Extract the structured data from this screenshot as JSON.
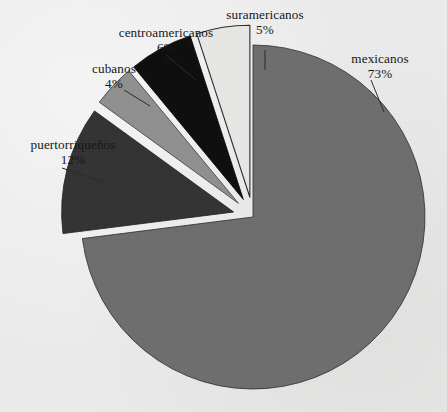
{
  "chart_data": {
    "type": "pie",
    "title": "",
    "subtitle": "",
    "xlabel": "",
    "ylabel": "",
    "legend_position": "none",
    "grid": false,
    "units": "percent",
    "categories": [
      "mexicanos",
      "puertorriqueños",
      "cubanos",
      "centroamericanos",
      "suramericanos"
    ],
    "values": [
      73,
      12,
      4,
      6,
      5
    ],
    "slices": [
      {
        "label": "mexicanos",
        "value": 73,
        "value_text": "73%",
        "color": "#6e6e6e",
        "outline": "#2b2b2b",
        "exploded": false,
        "start_angle_deg": 0,
        "end_angle_deg": 262.8
      },
      {
        "label": "puertorriqueños",
        "value": 12,
        "value_text": "12%",
        "color": "#333333",
        "outline": "#1a1a1a",
        "exploded": true,
        "start_angle_deg": 262.8,
        "end_angle_deg": 306.0
      },
      {
        "label": "cubanos",
        "value": 4,
        "value_text": "4%",
        "color": "#909090",
        "outline": "#3a3a3a",
        "exploded": true,
        "start_angle_deg": 306.0,
        "end_angle_deg": 320.4
      },
      {
        "label": "centroamericanos",
        "value": 6,
        "value_text": "6%",
        "color": "#0d0d0d",
        "outline": "#000000",
        "exploded": true,
        "start_angle_deg": 320.4,
        "end_angle_deg": 342.0
      },
      {
        "label": "suramericanos",
        "value": 5,
        "value_text": "5%",
        "color": "#e8e8e6",
        "outline": "#2b2b2b",
        "exploded": true,
        "start_angle_deg": 342.0,
        "end_angle_deg": 360.0
      }
    ],
    "background_color": "#ecedec"
  },
  "labels": {
    "mexicanos": {
      "name": "mexicanos",
      "pct": "73%"
    },
    "puertorriquenos": {
      "name": "puertorriqueños",
      "pct": "12%"
    },
    "cubanos": {
      "name": "cubanos",
      "pct": "4%"
    },
    "centroamericanos": {
      "name": "centroamericanos",
      "pct": "6%"
    },
    "suramericanos": {
      "name": "suramericanos",
      "pct": "5%"
    }
  }
}
